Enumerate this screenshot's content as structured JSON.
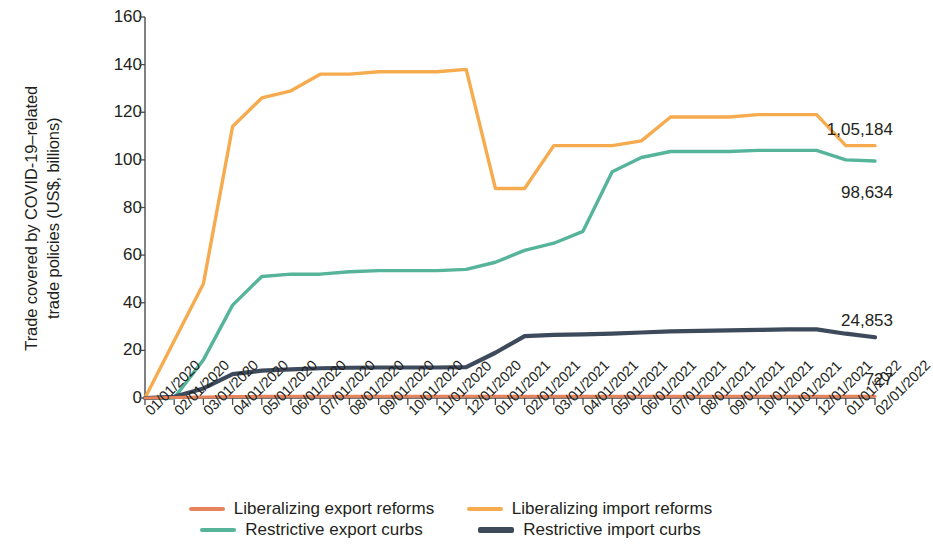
{
  "chart_data": {
    "type": "line",
    "title": "",
    "subtitle": "",
    "xlabel": "",
    "ylabel": "Trade covered by COVID-19–related trade policies (US$, billions)",
    "ylabel_lines": [
      "Trade covered by COVID-19–related",
      "trade policies (US$, billions)"
    ],
    "ylim": [
      0,
      160
    ],
    "yticks": [
      0,
      20,
      40,
      60,
      80,
      100,
      120,
      140,
      160
    ],
    "grid": false,
    "legend_position": "bottom",
    "x": [
      "01/01/2020",
      "02/01/2020",
      "03/01/2020",
      "04/01/2020",
      "05/01/2020",
      "06/01/2020",
      "07/01/2020",
      "08/01/2020",
      "09/01/2020",
      "10/01/2020",
      "11/01/2020",
      "12/01/2020",
      "01/01/2021",
      "02/01/2021",
      "03/01/2021",
      "04/01/2021",
      "05/01/2021",
      "06/01/2021",
      "07/01/2021",
      "08/01/2021",
      "09/01/2021",
      "10/01/2021",
      "11/01/2021",
      "12/01/2021",
      "01/01/2022",
      "02/01/2022"
    ],
    "series": [
      {
        "name": "Liberalizing export reforms",
        "color": "#e8845c",
        "width": 3.0,
        "end_label": "727",
        "values": [
          0.0,
          0.2,
          0.4,
          0.6,
          0.7,
          0.7,
          0.7,
          0.7,
          0.7,
          0.7,
          0.7,
          0.7,
          0.7,
          0.7,
          0.7,
          0.7,
          0.7,
          0.7,
          0.7,
          0.7,
          0.7,
          0.7,
          0.7,
          0.7,
          0.7,
          0.7
        ]
      },
      {
        "name": "Liberalizing import reforms",
        "color": "#f5ab4e",
        "width": 3.4,
        "end_label": "1,05,184",
        "values": [
          0,
          24,
          48,
          114,
          126,
          129,
          136,
          136,
          137,
          137,
          137,
          138,
          88,
          88,
          106,
          106,
          106,
          108,
          118,
          118,
          118,
          119,
          119,
          119,
          106,
          106
        ]
      },
      {
        "name": "Restrictive export curbs",
        "color": "#56b49a",
        "width": 3.4,
        "end_label": "98,634",
        "values": [
          0,
          0,
          16,
          39,
          51,
          52,
          52,
          53,
          53.5,
          53.5,
          53.5,
          54,
          57,
          62,
          65,
          70,
          95,
          101,
          103.5,
          103.5,
          103.5,
          104,
          104,
          104,
          100,
          99.5
        ]
      },
      {
        "name": "Restrictive import curbs",
        "color": "#3d4a5c",
        "width": 4.2,
        "end_label": "24,853",
        "values": [
          0,
          0.5,
          4,
          10,
          11.5,
          12,
          12.5,
          12.7,
          12.8,
          12.8,
          12.8,
          13,
          19,
          26,
          26.5,
          26.7,
          27,
          27.5,
          28,
          28.2,
          28.4,
          28.6,
          28.8,
          28.8,
          27,
          25.5
        ]
      }
    ]
  },
  "legend": {
    "rows": [
      [
        {
          "label": "Liberalizing export reforms",
          "color": "#e8845c",
          "thick": false
        },
        {
          "label": "Liberalizing import reforms",
          "color": "#f5ab4e",
          "thick": false
        }
      ],
      [
        {
          "label": "Restrictive export curbs",
          "color": "#56b49a",
          "thick": false
        },
        {
          "label": "Restrictive import curbs",
          "color": "#3d4a5c",
          "thick": true
        }
      ]
    ]
  }
}
